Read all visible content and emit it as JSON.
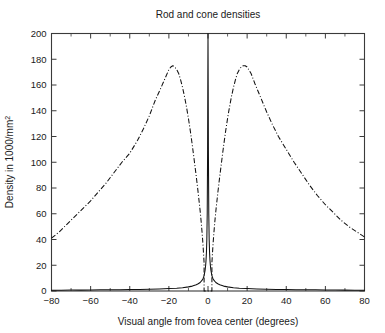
{
  "chart_data": {
    "type": "line",
    "title": "Rod and cone densities",
    "xlabel": "Visual angle from fovea center (degrees)",
    "ylabel": "Density in 1000/mm²",
    "xlim": [
      -80,
      80
    ],
    "ylim": [
      0,
      200
    ],
    "grid": false,
    "legend": "none",
    "xticks": [
      -80,
      -60,
      -40,
      -20,
      0,
      20,
      40,
      60,
      80
    ],
    "xtick_labels": [
      "−80",
      "−60",
      "−40",
      "−20",
      "0",
      "20",
      "40",
      "60",
      "80"
    ],
    "xminor_ticks": [
      -70,
      -50,
      -30,
      -10,
      10,
      30,
      50,
      70
    ],
    "yticks": [
      0,
      20,
      40,
      60,
      80,
      100,
      120,
      140,
      160,
      180,
      200
    ],
    "ytick_labels": [
      "0",
      "20",
      "40",
      "60",
      "80",
      "100",
      "120",
      "140",
      "160",
      "180",
      "200"
    ],
    "series": [
      {
        "name": "cones",
        "linestyle": "solid",
        "color": "#111111",
        "x": [
          -80,
          -75,
          -70,
          -65,
          -60,
          -55,
          -50,
          -45,
          -40,
          -35,
          -30,
          -25,
          -20,
          -16,
          -13,
          -10,
          -8,
          -6,
          -5,
          -4,
          -3,
          -2.5,
          -2,
          -1.5,
          -1.2,
          -1,
          -0.8,
          -0.6,
          -0.4,
          -0.2,
          -0.1,
          0,
          0.1,
          0.2,
          0.4,
          0.6,
          0.8,
          1,
          1.2,
          1.5,
          2,
          2.5,
          3,
          4,
          5,
          6,
          8,
          10,
          13,
          16,
          20,
          25,
          30,
          35,
          40,
          45,
          50,
          55,
          60,
          65,
          70,
          75,
          80
        ],
        "y": [
          0.6,
          0.6,
          0.7,
          0.7,
          0.8,
          0.9,
          0.9,
          1.0,
          1.1,
          1.2,
          1.4,
          1.6,
          1.9,
          2.2,
          2.6,
          3.2,
          3.8,
          4.8,
          5.6,
          6.6,
          8.4,
          9.8,
          12.0,
          16.0,
          20.0,
          24.0,
          30.0,
          40.0,
          60.0,
          110.0,
          160.0,
          200.0,
          160.0,
          110.0,
          60.0,
          40.0,
          30.0,
          24.0,
          20.0,
          16.0,
          12.0,
          9.8,
          8.4,
          6.6,
          5.6,
          4.8,
          3.8,
          3.2,
          2.6,
          2.2,
          1.9,
          1.6,
          1.4,
          1.2,
          1.1,
          1.0,
          0.9,
          0.9,
          0.8,
          0.7,
          0.7,
          0.6,
          0.6
        ]
      },
      {
        "name": "rods",
        "linestyle": "dash-dot",
        "color": "#111111",
        "x": [
          -80,
          -76,
          -72,
          -68,
          -64,
          -60,
          -56,
          -52,
          -48,
          -44,
          -40,
          -36,
          -33,
          -30,
          -27,
          -24,
          -22,
          -20,
          -19,
          -18,
          -17,
          -16,
          -15,
          -14,
          -13,
          -12,
          -11,
          -10,
          -9,
          -8,
          -7,
          -6,
          -5,
          -4,
          -3.5,
          -3,
          -2.8,
          -2.6,
          -2.4,
          -2.2,
          -2,
          -2,
          2,
          2,
          2.2,
          2.4,
          2.6,
          2.8,
          3,
          3.5,
          4,
          5,
          6,
          7,
          8,
          9,
          10,
          11,
          12,
          13,
          14,
          15,
          16,
          17,
          18,
          19,
          20,
          22,
          24,
          27,
          30,
          33,
          36,
          40,
          44,
          48,
          52,
          56,
          60,
          64,
          68,
          72,
          76,
          80
        ],
        "y": [
          41,
          46,
          52,
          58,
          64,
          70,
          77,
          84,
          92,
          100,
          107,
          117,
          126,
          136,
          148,
          158,
          165,
          172,
          174,
          175,
          174,
          172,
          169,
          164,
          158,
          151,
          143,
          134,
          124,
          113,
          101,
          89,
          76,
          62,
          54,
          45,
          41,
          37,
          32,
          27,
          22,
          0,
          0,
          22,
          27,
          32,
          37,
          41,
          45,
          54,
          62,
          76,
          89,
          101,
          113,
          124,
          134,
          143,
          151,
          158,
          164,
          169,
          172,
          174,
          175,
          175,
          174,
          169,
          161,
          150,
          139,
          129,
          120,
          110,
          100,
          91,
          82,
          74,
          67,
          61,
          55,
          50,
          46,
          42
        ]
      }
    ]
  }
}
